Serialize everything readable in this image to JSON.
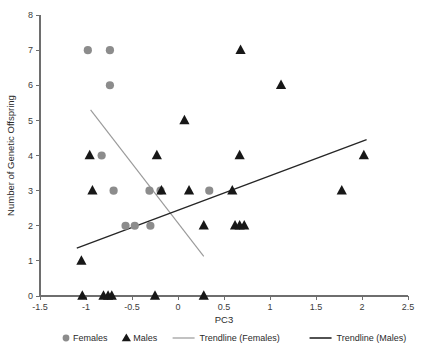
{
  "chart_data": {
    "type": "scatter",
    "title": "",
    "xlabel": "PC3",
    "ylabel": "Number of Genetic Offspring",
    "xlim": [
      -1.5,
      2.5
    ],
    "ylim": [
      0,
      8
    ],
    "xticks": [
      "-1.5",
      "-1",
      "-0.5",
      "0",
      "0.5",
      "1",
      "1.5",
      "2",
      "2.5"
    ],
    "xtick_values": [
      -1.5,
      -1,
      -0.5,
      0,
      0.5,
      1,
      1.5,
      2,
      2.5
    ],
    "yticks": [
      "0",
      "1",
      "2",
      "3",
      "4",
      "5",
      "6",
      "7",
      "8"
    ],
    "ytick_values": [
      0,
      1,
      2,
      3,
      4,
      5,
      6,
      7,
      8
    ],
    "grid": false,
    "legend_position": "bottom",
    "series": [
      {
        "name": "Females",
        "marker": "circle",
        "color": "#8c8c8c",
        "points": [
          [
            -0.98,
            7
          ],
          [
            -0.74,
            7
          ],
          [
            -0.74,
            6
          ],
          [
            -0.83,
            4
          ],
          [
            -0.7,
            3
          ],
          [
            -0.31,
            3
          ],
          [
            -0.19,
            3
          ],
          [
            0.34,
            3
          ],
          [
            -0.57,
            2
          ],
          [
            -0.47,
            2
          ],
          [
            -0.3,
            2
          ]
        ]
      },
      {
        "name": "Males",
        "marker": "triangle",
        "color": "#171717",
        "points": [
          [
            0.68,
            7
          ],
          [
            1.12,
            6
          ],
          [
            0.07,
            5
          ],
          [
            -0.96,
            4
          ],
          [
            -0.23,
            4
          ],
          [
            0.67,
            4
          ],
          [
            2.02,
            4
          ],
          [
            -0.93,
            3
          ],
          [
            -0.18,
            3
          ],
          [
            0.12,
            3
          ],
          [
            0.59,
            3
          ],
          [
            1.78,
            3
          ],
          [
            0.28,
            2
          ],
          [
            0.62,
            2
          ],
          [
            0.67,
            2
          ],
          [
            0.72,
            2
          ],
          [
            -1.05,
            1
          ],
          [
            -1.04,
            0
          ],
          [
            -0.81,
            0
          ],
          [
            -0.76,
            0
          ],
          [
            -0.72,
            0
          ],
          [
            -0.25,
            0
          ],
          [
            0.28,
            0
          ]
        ]
      }
    ],
    "trendlines": [
      {
        "name": "Trendline (Females)",
        "color": "#9a9a9a",
        "x0": -0.95,
        "y0": 5.3,
        "x1": 0.28,
        "y1": 1.13
      },
      {
        "name": "Trendline (Males)",
        "color": "#262626",
        "x0": -1.1,
        "y0": 1.36,
        "x1": 2.05,
        "y1": 4.45
      }
    ],
    "legend": [
      {
        "label": "Females",
        "marker": "circle",
        "color": "#8c8c8c"
      },
      {
        "label": "Males",
        "marker": "triangle",
        "color": "#171717"
      },
      {
        "label": "Trendline (Females)",
        "marker": "line",
        "color": "#9a9a9a"
      },
      {
        "label": "Trendline (Males)",
        "marker": "line",
        "color": "#262626"
      }
    ]
  }
}
